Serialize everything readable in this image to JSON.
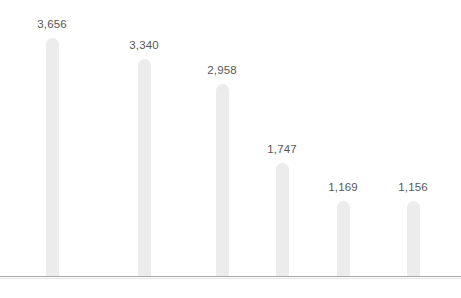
{
  "chart_data": {
    "type": "bar",
    "title": "",
    "subtitle": "",
    "xlabel": "",
    "ylabel": "",
    "categories": [
      "",
      "",
      "",
      "",
      "",
      ""
    ],
    "category_labels_visible": false,
    "category_labels_note": "x-axis category labels are cropped off by the bottom edge of the screenshot; only the uppermost pixel row of the glyphs is rendered and the text is unreadable",
    "values": [
      3656,
      3340,
      2958,
      1747,
      1169,
      1156
    ],
    "value_labels": [
      "3,656",
      "3,340",
      "2,958",
      "1,747",
      "1,169",
      "1,156"
    ],
    "ylim": [
      0,
      3656
    ],
    "grid": false,
    "y_axis_visible": false,
    "x_axis_visible": true,
    "legend": null,
    "legend_position": "none",
    "bar_centers_px": [
      52,
      144,
      222,
      282,
      343,
      413
    ],
    "bar_width_px": 13,
    "baseline_y_px": 277,
    "colors": {
      "background": "#ffffff",
      "bar": "#ececec",
      "value_label": "#58585a",
      "axis_line": "#a8a8a8",
      "axis_line_shadow": "#e4e4e4",
      "category_label": "#6b6b6b"
    }
  }
}
